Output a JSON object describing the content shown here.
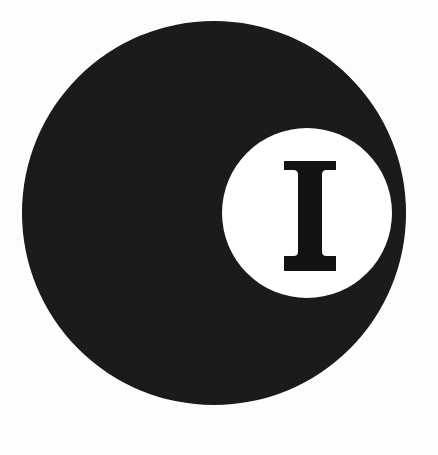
{
  "canvas": {
    "width": 438,
    "height": 455,
    "background_color": "#fdfdfd",
    "description": "Monochrome circular logo mark"
  },
  "logo": {
    "title": "Circular logo mark with letter I",
    "ink_color": "#141212",
    "paper_color": "#ffffff",
    "outer_disc": {
      "name": "black-disc",
      "shape": "circle",
      "center_x": 214,
      "center_y": 213,
      "radius": 192,
      "fill": "#141212"
    },
    "inner_disc": {
      "name": "white-counter-disc",
      "shape": "circle",
      "center_x": 307,
      "center_y": 213,
      "radius": 85,
      "fill": "#ffffff"
    },
    "letterform": {
      "name": "letter-i",
      "character": "I",
      "style": "serif-slab",
      "fill": "#141212",
      "left": 284,
      "right": 336,
      "top": 161,
      "bottom": 271,
      "stem_width": 24,
      "serif_width": 52,
      "serif_thickness": 9
    }
  }
}
